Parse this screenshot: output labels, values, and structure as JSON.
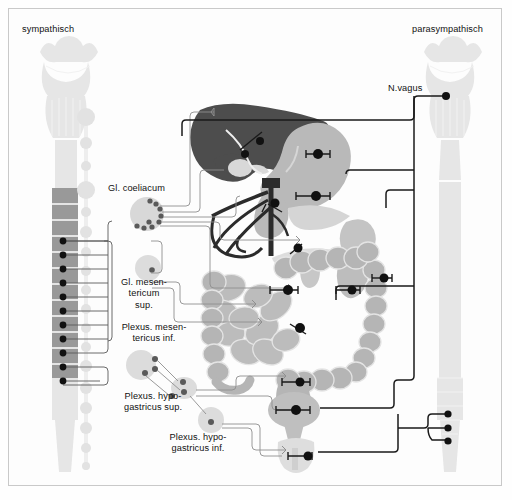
{
  "figure": {
    "title_left": "sympathisch",
    "title_right": "parasympathisch",
    "background_color": "#fdfdfd",
    "border_color": "#c9c9c9"
  },
  "labels": {
    "sympathetic": "sympathisch",
    "parasympathetic": "parasympathisch",
    "vagus_nerve": "N.vagus",
    "ganglion_coeliacum": "Gl. coeliacum",
    "ganglion_mesentericum_sup": "Gl. mesen-\ntericum\nsup.",
    "plexus_mesentericus_inf": "Plexus. mesen-\ntericus inf.",
    "plexus_hypogastricus_sup": "Plexus. hypo-\ngastricus sup.",
    "plexus_hypogastricus_inf": "Plexus. hypo-\ngastricus inf."
  },
  "colors": {
    "liver": "#4d4d4d",
    "organ_mid": "#b3b3b3",
    "organ_light": "#cfcfcf",
    "organ_pale": "#e0e0e0",
    "cns_pale": "#e6e6e6",
    "spinal_segment": "#999999",
    "ganglion_fill": "#d8d8d8",
    "nerve_dark": "#1a1a1a",
    "nerve_light": "#8a8a8a",
    "vessel": "#2b2b2b",
    "text": "#111111"
  },
  "structures": {
    "left_column": {
      "name": "sympathetic-cns-and-trunk",
      "spinal_segment_count": 12,
      "sympathetic_trunk_bead_count": 16,
      "preganglionic_root_count": 11
    },
    "right_column": {
      "name": "parasympathetic-cns-and-vagus",
      "vagus_origin_dots": 1,
      "sacral_outflow_dots": 3
    },
    "ganglia": [
      {
        "name": "ganglion-coeliacum",
        "label": "Gl. coeliacum",
        "synapse_dots": 9
      },
      {
        "name": "ganglion-mesentericum-superius",
        "label": "Gl. mesentericum sup.",
        "synapse_dots": 1
      },
      {
        "name": "plexus-hypogastricus-superior",
        "label": "Plexus. hypogastricus sup.",
        "synapse_dots": 3
      },
      {
        "name": "plexus-hypogastricus-inferior",
        "label": "Plexus. hypogastricus inf.",
        "synapse_dots": 1
      }
    ],
    "organs": [
      {
        "name": "liver",
        "shade": "dark"
      },
      {
        "name": "gallbladder",
        "shade": "pale"
      },
      {
        "name": "stomach",
        "shade": "mid"
      },
      {
        "name": "duodenum",
        "shade": "mid"
      },
      {
        "name": "pancreas",
        "shade": "pale"
      },
      {
        "name": "spleen",
        "shade": "mid"
      },
      {
        "name": "kidney-left",
        "shade": "mid"
      },
      {
        "name": "kidney-right",
        "shade": "mid"
      },
      {
        "name": "small-intestine",
        "shade": "mid"
      },
      {
        "name": "colon",
        "shade": "mid"
      },
      {
        "name": "rectum",
        "shade": "mid"
      },
      {
        "name": "bladder",
        "shade": "mid"
      },
      {
        "name": "genital-organs",
        "shade": "pale"
      },
      {
        "name": "mesenteric-vessel-tree",
        "shade": "vessel"
      }
    ]
  }
}
